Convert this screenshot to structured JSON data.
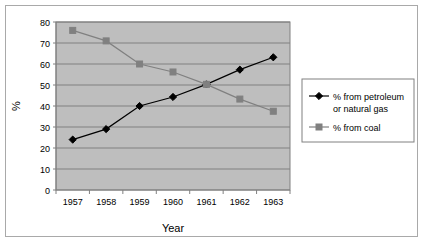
{
  "chart_data": {
    "type": "line",
    "title": "",
    "xlabel": "Year",
    "ylabel": "%",
    "categories": [
      "1957",
      "1958",
      "1959",
      "1960",
      "1961",
      "1962",
      "1963"
    ],
    "ylim": [
      0,
      80
    ],
    "ytick_step": 10,
    "yticks": [
      "0",
      "10",
      "20",
      "30",
      "40",
      "50",
      "60",
      "70",
      "80"
    ],
    "grid": "horizontal",
    "legend_position": "right",
    "plot_background": "#bebebe",
    "series": [
      {
        "name": "% from petroleum or natural gas",
        "marker": "diamond",
        "color": "#000000",
        "values": [
          24,
          29,
          40,
          44.3,
          50.3,
          57.3,
          63.2
        ]
      },
      {
        "name": "% from coal",
        "marker": "square",
        "color": "#808080",
        "values": [
          76,
          71,
          60,
          56.2,
          50.3,
          43.3,
          37.5
        ]
      }
    ]
  },
  "legend": {
    "entries": [
      {
        "line1": "% from petroleum",
        "line2": "or natural gas"
      },
      {
        "line1": "% from coal",
        "line2": ""
      }
    ]
  }
}
